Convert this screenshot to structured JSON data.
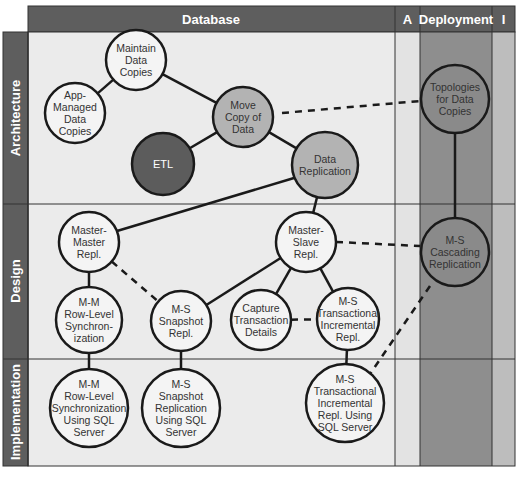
{
  "columns": [
    {
      "id": "database",
      "label": "Database"
    },
    {
      "id": "a",
      "label": "A"
    },
    {
      "id": "deployment",
      "label": "Deployment"
    },
    {
      "id": "i",
      "label": "I"
    }
  ],
  "rows": [
    {
      "id": "architecture",
      "label": "Architecture"
    },
    {
      "id": "design",
      "label": "Design"
    },
    {
      "id": "implementation",
      "label": "Implementation"
    }
  ],
  "colors": {
    "header_bg": "#5e5e5e",
    "row_label_bg": "#5e5e5e",
    "cell_light": "#ebebeb",
    "cell_a": "#e3e3e3",
    "deployment_col": "#8e8e8e",
    "i_col": "#bdbdbd",
    "node_white": "#f4f4f4",
    "node_gray": "#b3b3b3",
    "node_dark": "#5c5c5c",
    "node_deploy": "#8a8a8a",
    "line": "#1a1a1a"
  },
  "nodes": [
    {
      "id": "maintain",
      "lines": [
        "Maintain",
        "Data",
        "Copies"
      ],
      "style": "white"
    },
    {
      "id": "appmanaged",
      "lines": [
        "App-",
        "Managed",
        "Data",
        "Copies"
      ],
      "style": "white"
    },
    {
      "id": "movecopy",
      "lines": [
        "Move",
        "Copy of",
        "Data"
      ],
      "style": "gray"
    },
    {
      "id": "etl",
      "lines": [
        "ETL"
      ],
      "style": "dark"
    },
    {
      "id": "datarepl",
      "lines": [
        "Data",
        "Replication"
      ],
      "style": "gray"
    },
    {
      "id": "topologies",
      "lines": [
        "Topologies",
        "for Data",
        "Copies"
      ],
      "style": "deploy"
    },
    {
      "id": "mmrepl",
      "lines": [
        "Master-",
        "Master",
        "Repl."
      ],
      "style": "white"
    },
    {
      "id": "msrepl",
      "lines": [
        "Master-",
        "Slave",
        "Repl."
      ],
      "style": "white"
    },
    {
      "id": "cascading",
      "lines": [
        "M-S",
        "Cascading",
        "Replication"
      ],
      "style": "deploy"
    },
    {
      "id": "mmrowsync",
      "lines": [
        "M-M",
        "Row-Level",
        "Synchron-",
        "ization"
      ],
      "style": "white"
    },
    {
      "id": "mssnapshot",
      "lines": [
        "M-S",
        "Snapshot",
        "Repl."
      ],
      "style": "white"
    },
    {
      "id": "capture",
      "lines": [
        "Capture",
        "Transaction",
        "Details"
      ],
      "style": "white"
    },
    {
      "id": "mstrans",
      "lines": [
        "M-S",
        "Transactional",
        "Incremental",
        "Repl."
      ],
      "style": "white"
    },
    {
      "id": "mmrowsql",
      "lines": [
        "M-M",
        "Row-Level",
        "Synchronization",
        "Using SQL",
        "Server"
      ],
      "style": "white"
    },
    {
      "id": "mssnapsql",
      "lines": [
        "M-S",
        "Snapshot",
        "Replication",
        "Using SQL",
        "Server"
      ],
      "style": "white"
    },
    {
      "id": "mstranssql",
      "lines": [
        "M-S",
        "Transactional",
        "Incremental",
        "Repl. Using",
        "SQL Server"
      ],
      "style": "white"
    }
  ],
  "edges": [
    {
      "from": "maintain",
      "to": "appmanaged",
      "style": "solid"
    },
    {
      "from": "maintain",
      "to": "movecopy",
      "style": "solid"
    },
    {
      "from": "movecopy",
      "to": "etl",
      "style": "solid"
    },
    {
      "from": "movecopy",
      "to": "datarepl",
      "style": "solid"
    },
    {
      "from": "movecopy",
      "to": "topologies",
      "style": "dashed"
    },
    {
      "from": "datarepl",
      "to": "mmrepl",
      "style": "solid"
    },
    {
      "from": "datarepl",
      "to": "msrepl",
      "style": "solid"
    },
    {
      "from": "topologies",
      "to": "cascading",
      "style": "solid"
    },
    {
      "from": "msrepl",
      "to": "cascading",
      "style": "dashed"
    },
    {
      "from": "mmrepl",
      "to": "mmrowsync",
      "style": "solid"
    },
    {
      "from": "mmrepl",
      "to": "mssnapshot",
      "style": "dashed"
    },
    {
      "from": "msrepl",
      "to": "mssnapshot",
      "style": "solid"
    },
    {
      "from": "msrepl",
      "to": "capture",
      "style": "solid"
    },
    {
      "from": "msrepl",
      "to": "mstrans",
      "style": "solid"
    },
    {
      "from": "capture",
      "to": "mstrans",
      "style": "dashed"
    },
    {
      "from": "cascading",
      "to": "mstranssql",
      "style": "dashed"
    },
    {
      "from": "mmrowsync",
      "to": "mmrowsql",
      "style": "solid"
    },
    {
      "from": "mssnapshot",
      "to": "mssnapsql",
      "style": "solid"
    },
    {
      "from": "mstrans",
      "to": "mstranssql",
      "style": "solid"
    }
  ]
}
